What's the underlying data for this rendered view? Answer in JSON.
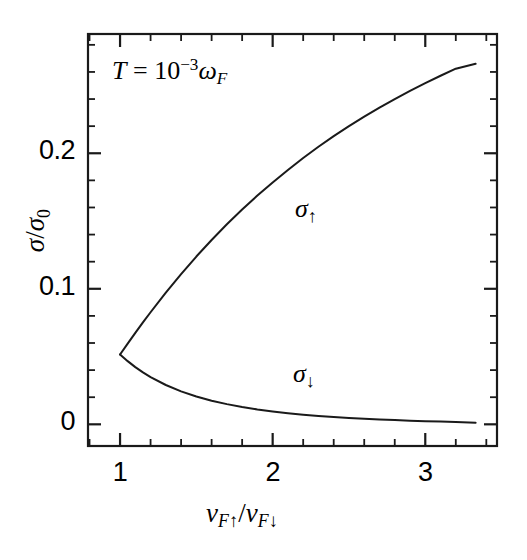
{
  "chart_data": {
    "type": "line",
    "title": "",
    "subtitle": "",
    "xlabel": "v_F↑ / v_F↓",
    "ylabel": "σ / σ₀",
    "xlim": [
      0.79,
      3.47
    ],
    "ylim": [
      -0.016,
      0.288
    ],
    "grid": false,
    "legend_position": "inline-annotations",
    "x_major_ticks": [
      1,
      2,
      3
    ],
    "x_major_tick_labels": [
      "1",
      "2",
      "3"
    ],
    "x_minor_tick_step": 0.2,
    "y_major_ticks": [
      0,
      0.1,
      0.2
    ],
    "y_major_tick_labels": [
      "0",
      "0.1",
      "0.2"
    ],
    "y_minor_tick_step": 0.02,
    "annotations": [
      {
        "name": "temperature",
        "text": "T = 10⁻³ω_F",
        "x": 1.15,
        "y": 0.273
      }
    ],
    "series": [
      {
        "name": "σ↑",
        "label_x": 2.25,
        "label_y": 0.135,
        "x": [
          1.0,
          1.05,
          1.1,
          1.15,
          1.2,
          1.3,
          1.4,
          1.5,
          1.6,
          1.7,
          1.8,
          1.9,
          2.0,
          2.1,
          2.2,
          2.3,
          2.4,
          2.5,
          2.6,
          2.7,
          2.8,
          2.9,
          3.0,
          3.1,
          3.2,
          3.33
        ],
        "y": [
          0.0515,
          0.0595,
          0.0675,
          0.0752,
          0.0827,
          0.0972,
          0.1108,
          0.1238,
          0.136,
          0.1476,
          0.1585,
          0.1688,
          0.1785,
          0.1877,
          0.1965,
          0.2048,
          0.2126,
          0.22,
          0.227,
          0.2337,
          0.24,
          0.246,
          0.2517,
          0.2572,
          0.2624,
          0.266
        ]
      },
      {
        "name": "σ↓",
        "label_x": 2.22,
        "label_y": 0.0378,
        "x": [
          1.0,
          1.05,
          1.1,
          1.15,
          1.2,
          1.3,
          1.4,
          1.5,
          1.6,
          1.7,
          1.8,
          1.9,
          2.0,
          2.1,
          2.2,
          2.3,
          2.4,
          2.5,
          2.6,
          2.7,
          2.8,
          2.9,
          3.0,
          3.1,
          3.2,
          3.33
        ],
        "y": [
          0.0515,
          0.0466,
          0.0422,
          0.0383,
          0.0348,
          0.029,
          0.0243,
          0.0205,
          0.0174,
          0.0149,
          0.0128,
          0.011,
          0.0095,
          0.0082,
          0.0071,
          0.0062,
          0.0054,
          0.0047,
          0.0041,
          0.0035,
          0.0031,
          0.0027,
          0.0023,
          0.002,
          0.0017,
          0.0012
        ]
      }
    ]
  },
  "labels": {
    "annotation_T": "T",
    "annotation_equals": " = 10",
    "annotation_exp": "−3",
    "annotation_omega": "ω",
    "annotation_omega_sub": "F",
    "y_title_sigma": "σ",
    "y_title_slash": "/",
    "y_title_sigma0": "σ",
    "y_title_sub0": "0",
    "x_title_v1": "v",
    "x_title_v1_subF": "F",
    "x_title_v1_arrow": "↑",
    "x_title_slash": "/",
    "x_title_v2": "v",
    "x_title_v2_subF": "F",
    "x_title_v2_arrow": "↓",
    "curve_up_sigma": "σ",
    "curve_up_arrow": "↑",
    "curve_down_sigma": "σ",
    "curve_down_arrow": "↓",
    "xtick_1": "1",
    "xtick_2": "2",
    "xtick_3": "3",
    "ytick_0": "0",
    "ytick_01": "0.1",
    "ytick_02": "0.2"
  },
  "style": {
    "line_color": "#1a1a1a",
    "axis_color": "#1a1a1a",
    "background": "#ffffff"
  }
}
